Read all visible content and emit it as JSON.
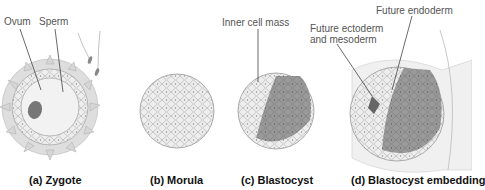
{
  "panels": [
    {
      "id": "a",
      "caption": "(a) Zygote",
      "labels": [
        "Ovum",
        "Sperm"
      ]
    },
    {
      "id": "b",
      "caption": "(b) Morula",
      "labels": []
    },
    {
      "id": "c",
      "caption": "(c) Blastocyst",
      "labels": [
        "Inner cell mass"
      ]
    },
    {
      "id": "d",
      "caption": "(d) Blastocyst embedding",
      "labels": [
        "Future ectoderm",
        "and mesoderm",
        "Future endoderm"
      ]
    }
  ]
}
